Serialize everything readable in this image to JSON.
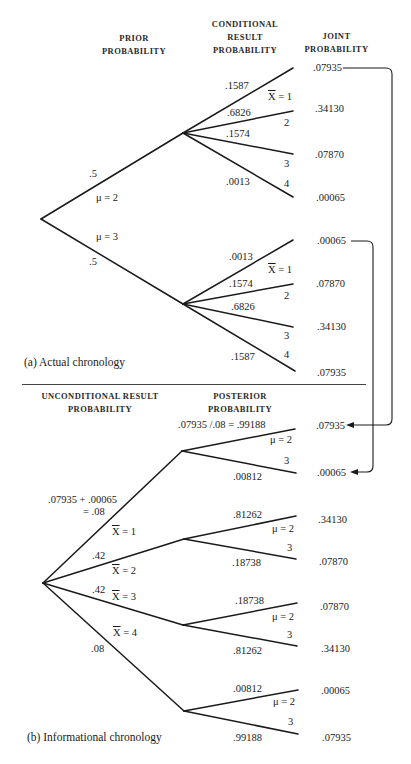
{
  "headers": {
    "prior": [
      "PRIOR",
      "PROBABILITY"
    ],
    "conditional": [
      "CONDITIONAL",
      "RESULT",
      "PROBABILITY"
    ],
    "joint": [
      "JOINT",
      "PROBABILITY"
    ],
    "unconditional": [
      "UNCONDITIONAL RESULT",
      "PROBABILITY"
    ],
    "posterior": [
      "POSTERIOR",
      "PROBABILITY"
    ]
  },
  "captions": {
    "a": "(a)  Actual chronology",
    "b": "(b)  Informational chronology"
  },
  "actual": {
    "prior_top": ".5",
    "mu_top": "μ = 2",
    "mu_bottom": "μ = 3",
    "prior_bottom": ".5",
    "upper": {
      "probs": [
        ".1587",
        ".6826",
        ".1574",
        ".0013"
      ],
      "outcomes": [
        "X = 1",
        "2",
        "3",
        "4"
      ],
      "joint": [
        ".07935",
        ".34130",
        ".07870",
        ".00065"
      ]
    },
    "lower": {
      "probs": [
        ".0013",
        ".1574",
        ".6826",
        ".1587"
      ],
      "outcomes": [
        "X = 1",
        "2",
        "3",
        "4"
      ],
      "joint": [
        ".00065",
        ".07870",
        ".34130",
        ".07935"
      ]
    }
  },
  "informational": {
    "uncond": {
      "formula_line1": ".07935 + .00065",
      "formula_line2": "= .08",
      "p2": ".42",
      "p3": ".42",
      "p4": ".08",
      "x1": "X = 1",
      "x2": "X = 2",
      "x3": "X = 3",
      "x4": "X = 4"
    },
    "groups": [
      {
        "post_top": ".07935 /.08 = .99188",
        "post_bottom": ".00812",
        "mu_top": "μ = 2",
        "mu_bottom": "3",
        "joint": [
          ".07935",
          ".00065"
        ]
      },
      {
        "post_top": ".81262",
        "post_bottom": ".18738",
        "mu_top": "μ = 2",
        "mu_bottom": "3",
        "joint": [
          ".34130",
          ".07870"
        ]
      },
      {
        "post_top": ".18738",
        "post_bottom": ".81262",
        "mu_top": "μ = 2",
        "mu_bottom": "3",
        "joint": [
          ".07870",
          ".34130"
        ]
      },
      {
        "post_top": ".00812",
        "post_bottom": ".99188",
        "mu_top": "μ = 2",
        "mu_bottom": "3",
        "joint": [
          ".00065",
          ".07935"
        ]
      }
    ]
  },
  "colors": {
    "line": "#1a1a1a",
    "text": "#1a1a1a",
    "background": "#ffffff"
  }
}
